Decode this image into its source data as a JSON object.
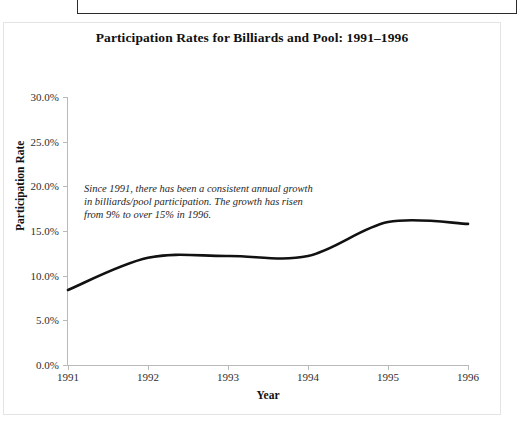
{
  "page_header": {
    "text": "Recreation Trends and Markets: The 21st Century"
  },
  "figure": {
    "title": "Participation Rates for Billiards and Pool: 1991–1996",
    "annotation": "Since 1991,  there has been a consistent annual growth in billiards/pool participation.  The growth has risen from 9% to over 15% in 1996.",
    "line_color": "#111111",
    "axis_color": "#b9b9b9"
  },
  "chart_data": {
    "type": "line",
    "title": "Participation Rates for Billiards and Pool: 1991–1996",
    "xlabel": "Year",
    "ylabel": "Participation Rate",
    "x": [
      1991,
      1992,
      1993,
      1994,
      1995,
      1996
    ],
    "categories": [
      "1991",
      "1992",
      "1993",
      "1994",
      "1995",
      "1996"
    ],
    "values": [
      8.4,
      12.0,
      12.2,
      12.2,
      16.0,
      15.8
    ],
    "series": [
      {
        "name": "Billiards and Pool participation rate",
        "values": [
          8.4,
          12.0,
          12.2,
          12.2,
          16.0,
          15.8
        ]
      }
    ],
    "ylim": [
      0,
      30
    ],
    "xlim": [
      1991,
      1996
    ],
    "ytick_labels": [
      "0.0%",
      "5.0%",
      "10.0%",
      "15.0%",
      "20.0%",
      "25.0%",
      "30.0%"
    ],
    "ytick_values": [
      0,
      5,
      10,
      15,
      20,
      25,
      30
    ],
    "xtick_labels": [
      "1991",
      "1992",
      "1993",
      "1994",
      "1995",
      "1996"
    ],
    "grid": false,
    "legend": "none",
    "annotations": [
      {
        "text": "Since 1991,  there has been a consistent annual growth in billiards/pool participation.  The growth has risen from 9% to over 15% in 1996."
      }
    ]
  }
}
